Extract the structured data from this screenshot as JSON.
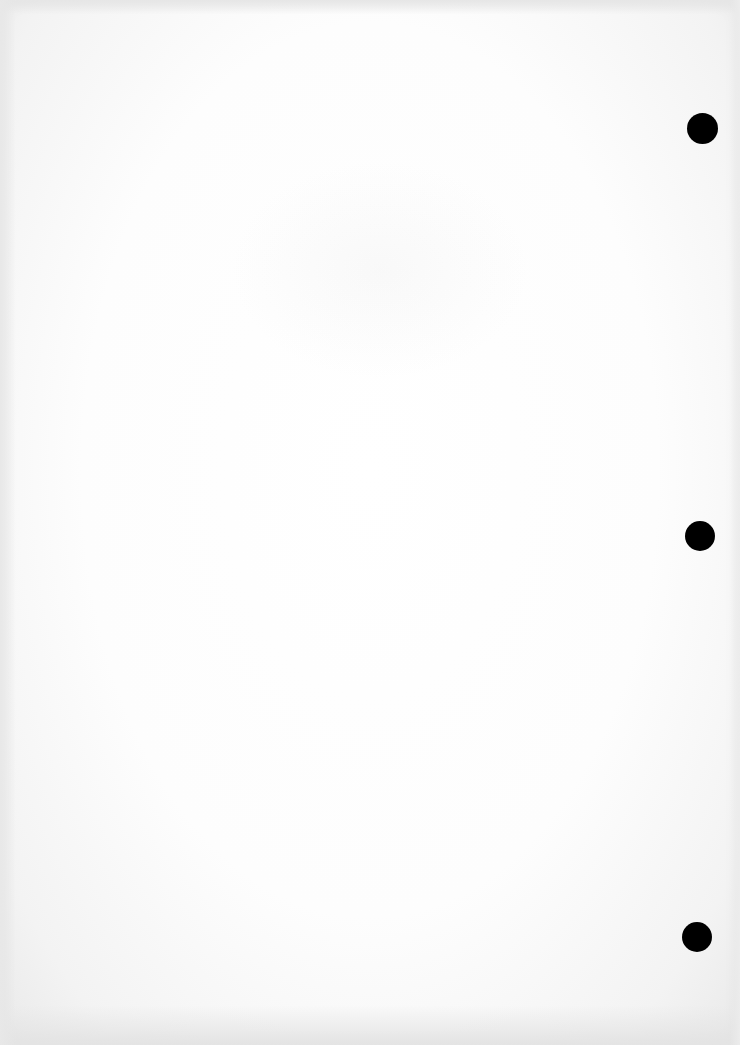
{
  "document": {
    "type": "blank scanned page",
    "text": "",
    "punch_holes": [
      {
        "cx": 702,
        "cy": 128,
        "d": 31,
        "color": "#000000"
      },
      {
        "cx": 700,
        "cy": 536,
        "d": 30,
        "color": "#000000"
      },
      {
        "cx": 697,
        "cy": 937,
        "d": 30,
        "color": "#000000"
      }
    ],
    "colors": {
      "paper": "#ffffff",
      "edge_shadow": "#e6e6e6"
    }
  }
}
